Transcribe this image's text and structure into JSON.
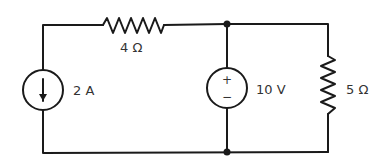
{
  "diagram": {
    "type": "circuit",
    "components": {
      "current_source": {
        "label": "2 A",
        "direction": "down"
      },
      "resistor_top": {
        "label": "4 Ω"
      },
      "voltage_source": {
        "label": "10 V",
        "plus": "+",
        "minus": "−"
      },
      "resistor_right": {
        "label": "5 Ω"
      }
    },
    "colors": {
      "line": "#1a1a1a",
      "text": "#333333",
      "background": "#ffffff"
    }
  }
}
